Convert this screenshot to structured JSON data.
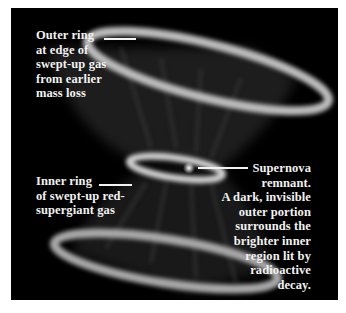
{
  "figure": {
    "colors": {
      "background": "#000000",
      "frame": "#ffffff",
      "ring_glow": "#d8d8d8",
      "label_text": "#f2f2f2"
    },
    "labels": {
      "outer_ring": "Outer ring\nat edge of\nswept-up gas\nfrom earlier\nmass loss",
      "inner_ring": "Inner ring\nof swept-up red-\nsupergiant gas",
      "supernova_remnant": "Supernova\nremnant.\nA dark, invisible\nouter portion\nsurrounds the\nbrighter inner\nregion lit by\nradioactive\ndecay."
    }
  }
}
